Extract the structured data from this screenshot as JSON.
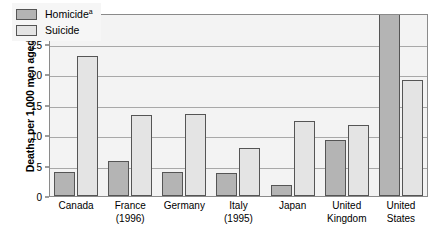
{
  "chart_data": {
    "type": "bar",
    "title": "",
    "xlabel": "",
    "ylabel": "Deaths per 1,000 men aged 15–24",
    "ylim": [
      0,
      30
    ],
    "yticks": [
      0,
      5,
      10,
      15,
      20,
      25,
      30
    ],
    "grid": true,
    "legend_position": "top-left",
    "categories": [
      "Canada",
      "France (1996)",
      "Germany",
      "Italy (1995)",
      "Japan",
      "United Kingdom",
      "United States"
    ],
    "category_lines": [
      [
        "Canada",
        ""
      ],
      [
        "France",
        "(1996)"
      ],
      [
        "Germany",
        ""
      ],
      [
        "Italy",
        "(1995)"
      ],
      [
        "Japan",
        ""
      ],
      [
        "United",
        "Kingdom"
      ],
      [
        "United",
        "States"
      ]
    ],
    "series": [
      {
        "name": "Homicide",
        "footnote_marker": "a",
        "color": "#b4b4b4",
        "values": [
          4.0,
          5.8,
          4.0,
          3.8,
          1.8,
          9.2,
          30.0
        ]
      },
      {
        "name": "Suicide",
        "footnote_marker": "",
        "color": "#e4e4e4",
        "values": [
          22.9,
          13.3,
          13.5,
          7.8,
          12.3,
          11.6,
          19.0
        ]
      }
    ]
  },
  "legend": {
    "items": [
      {
        "label": "Homicide",
        "sup": "a"
      },
      {
        "label": "Suicide",
        "sup": ""
      }
    ]
  }
}
